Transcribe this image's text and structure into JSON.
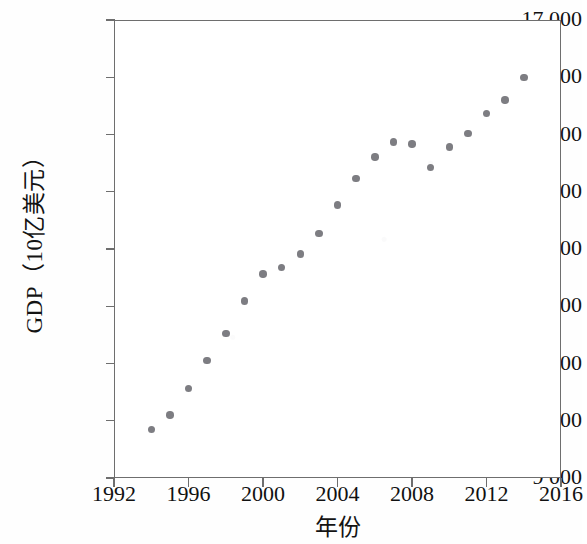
{
  "chart_data": {
    "type": "scatter",
    "title": "",
    "xlabel": "年份",
    "ylabel": "GDP（10亿美元）",
    "xlim": [
      1992,
      2016
    ],
    "ylim": [
      9000,
      17000
    ],
    "grid": false,
    "legend": null,
    "marker": {
      "shape": "circle",
      "color": "#7d7d82",
      "size_px": 7.5
    },
    "axis_color": "#6e6e6e",
    "xticks": [
      "1992",
      "1996",
      "2000",
      "2004",
      "2008",
      "2012",
      "2016"
    ],
    "xtick_values": [
      1992,
      1996,
      2000,
      2004,
      2008,
      2012,
      2016
    ],
    "yticks": [
      "9 000",
      "10 000",
      "11 000",
      "12 000",
      "13 000",
      "14 000",
      "15 000",
      "16 000",
      "17 000"
    ],
    "ytick_values": [
      9000,
      10000,
      11000,
      12000,
      13000,
      14000,
      15000,
      16000,
      17000
    ],
    "x": [
      1994,
      1995,
      1996,
      1997,
      1998,
      1999,
      2000,
      2001,
      2002,
      2003,
      2004,
      2005,
      2006,
      2007,
      2008,
      2009,
      2010,
      2011,
      2012,
      2013,
      2014
    ],
    "values": [
      9850,
      10100,
      10560,
      11050,
      11520,
      12090,
      12560,
      12680,
      12910,
      13270,
      13770,
      14230,
      14610,
      14870,
      14830,
      14420,
      14780,
      15020,
      15370,
      15600,
      16000
    ],
    "points": [
      {
        "x": 1994,
        "y": 9850
      },
      {
        "x": 1995,
        "y": 10100
      },
      {
        "x": 1996,
        "y": 10560
      },
      {
        "x": 1997,
        "y": 11050
      },
      {
        "x": 1998,
        "y": 11520
      },
      {
        "x": 1999,
        "y": 12090
      },
      {
        "x": 2000,
        "y": 12560
      },
      {
        "x": 2001,
        "y": 12680
      },
      {
        "x": 2002,
        "y": 12910
      },
      {
        "x": 2003,
        "y": 13270
      },
      {
        "x": 2004,
        "y": 13770
      },
      {
        "x": 2005,
        "y": 14230
      },
      {
        "x": 2006,
        "y": 14610
      },
      {
        "x": 2007,
        "y": 14870
      },
      {
        "x": 2008,
        "y": 14830
      },
      {
        "x": 2009,
        "y": 14420
      },
      {
        "x": 2010,
        "y": 14780
      },
      {
        "x": 2011,
        "y": 15020
      },
      {
        "x": 2012,
        "y": 15370
      },
      {
        "x": 2013,
        "y": 15600
      },
      {
        "x": 2014,
        "y": 16000
      }
    ]
  }
}
